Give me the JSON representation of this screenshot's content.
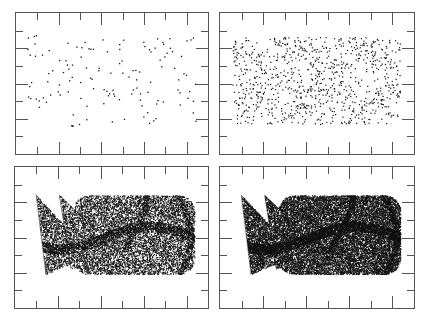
{
  "figure": {
    "title": "",
    "layout": "2x2 grid of scatter panels",
    "background": "#ffffff",
    "frame_color": "#555555",
    "point_color": "#111111"
  },
  "chart_data": [
    {
      "type": "scatter",
      "panel": "top-left",
      "title": "",
      "xlabel": "",
      "ylabel": "",
      "description": "Sparse scatter of ~130 points, uniformly spread",
      "approx_points": 130,
      "grid": false,
      "x_ticks": 8,
      "y_ticks": 7,
      "tick_labels": []
    },
    {
      "type": "scatter",
      "panel": "top-right",
      "title": "",
      "xlabel": "",
      "ylabel": "",
      "description": "Medium-density scatter of ~900 points, filling a rectangular region with wavy bands",
      "approx_points": 900,
      "grid": false,
      "x_ticks": 8,
      "y_ticks": 7,
      "tick_labels": []
    },
    {
      "type": "scatter",
      "panel": "bottom-left",
      "title": "",
      "xlabel": "",
      "ylabel": "",
      "description": "Dense attractor point cloud (~12000 points): three triangular lobes on the left, rounded body on the right with dark curved filaments",
      "approx_points": 12000,
      "grid": false,
      "x_ticks": 8,
      "y_ticks": 7,
      "tick_labels": []
    },
    {
      "type": "scatter",
      "panel": "bottom-right",
      "title": "",
      "xlabel": "",
      "ylabel": "",
      "description": "Denser attractor point cloud (~22000 points), same shape as bottom-left",
      "approx_points": 22000,
      "grid": false,
      "x_ticks": 8,
      "y_ticks": 7,
      "tick_labels": []
    }
  ],
  "panels": [
    {
      "id": "tl",
      "x": 15,
      "y": 12,
      "w": 194,
      "h": 143,
      "points": 130,
      "kind": "sparse",
      "seed": 11
    },
    {
      "id": "tr",
      "x": 219,
      "y": 12,
      "w": 196,
      "h": 143,
      "points": 900,
      "kind": "medium",
      "seed": 23
    },
    {
      "id": "bl",
      "x": 14,
      "y": 166,
      "w": 195,
      "h": 143,
      "points": 12000,
      "kind": "attractor",
      "seed": 37
    },
    {
      "id": "br",
      "x": 219,
      "y": 166,
      "w": 196,
      "h": 143,
      "points": 22000,
      "kind": "attractor",
      "seed": 51
    }
  ]
}
